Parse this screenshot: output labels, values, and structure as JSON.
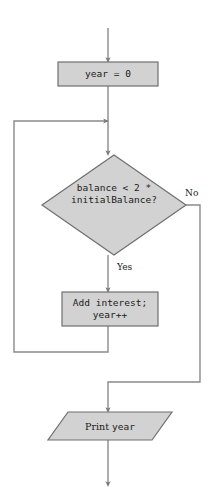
{
  "diagram": {
    "type": "flowchart",
    "canvas": {
      "width": 216,
      "height": 504
    },
    "colors": {
      "shape_fill": "#d2d2d2",
      "shape_stroke": "#6f6f6f",
      "connector": "#8a8a8a",
      "text": "#1a1a1a",
      "background": "#ffffff"
    },
    "nodes": [
      {
        "id": "init",
        "kind": "process",
        "shape": "rectangle",
        "lines": [
          "year = 0"
        ],
        "x": 58,
        "y": 62,
        "w": 100,
        "h": 24
      },
      {
        "id": "condition",
        "kind": "decision",
        "shape": "diamond",
        "lines": [
          "balance < 2 *",
          "initialBalance?"
        ],
        "x": 42,
        "y": 155,
        "w": 144,
        "h": 100
      },
      {
        "id": "body",
        "kind": "process",
        "shape": "rectangle",
        "lines": [
          "Add interest;",
          "year++"
        ],
        "x": 62,
        "y": 292,
        "w": 96,
        "h": 34
      },
      {
        "id": "output",
        "kind": "input-output",
        "shape": "parallelogram",
        "lines": [
          "Print year"
        ],
        "serif_part": "Print ",
        "mono_part": "year",
        "x": 48,
        "y": 412,
        "w": 124,
        "h": 28
      }
    ],
    "edge_labels": [
      {
        "id": "no-label",
        "text": "No",
        "x": 185,
        "y": 188
      },
      {
        "id": "yes-label",
        "text": "Yes",
        "x": 117,
        "y": 262
      }
    ],
    "edges": [
      {
        "id": "entry-to-init",
        "from": "start",
        "to": "init",
        "label": ""
      },
      {
        "id": "init-to-condition",
        "from": "init",
        "to": "condition",
        "label": ""
      },
      {
        "id": "condition-yes-to-body",
        "from": "condition",
        "to": "body",
        "label": "Yes"
      },
      {
        "id": "condition-no-to-output",
        "from": "condition",
        "to": "output",
        "label": "No"
      },
      {
        "id": "body-loop-back",
        "from": "body",
        "to": "condition",
        "label": ""
      },
      {
        "id": "output-to-exit",
        "from": "output",
        "to": "end",
        "label": ""
      }
    ]
  }
}
